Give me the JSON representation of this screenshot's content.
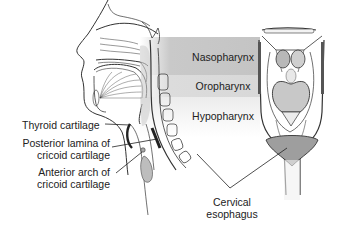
{
  "diagram": {
    "regions": [
      {
        "label": "Nasopharynx",
        "color": "#c6c6c6"
      },
      {
        "label": "Oropharynx",
        "color": "#dadada"
      },
      {
        "label": "Hypopharynx",
        "color": "#ececec"
      }
    ],
    "labels": {
      "thyroid": "Thyroid cartilage",
      "posterior_line1": "Posterior lamina of",
      "posterior_line2": "cricoid cartilage",
      "anterior_line1": "Anterior arch of",
      "anterior_line2": "cricoid cartilage",
      "cervical_line1": "Cervical",
      "cervical_line2": "esophagus"
    },
    "colors": {
      "line": "#333333",
      "tissue": "#bdbdbd"
    }
  }
}
